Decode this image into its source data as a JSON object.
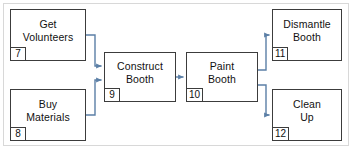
{
  "diagram": {
    "type": "precedence-network-diagram",
    "connector_color": "#5b7fa6",
    "box_border_color": "#3c3c3c",
    "frame_color": "#d8d8d8",
    "background": "#ffffff",
    "nodes": [
      {
        "id": "get-volunteers",
        "label": "Get\nVolunteers",
        "number": "7",
        "x": 10,
        "y": 9,
        "w": 76,
        "h": 52
      },
      {
        "id": "buy-materials",
        "label": "Buy\nMaterials",
        "number": "8",
        "x": 10,
        "y": 89,
        "w": 76,
        "h": 52
      },
      {
        "id": "construct-booth",
        "label": "Construct\nBooth",
        "number": "9",
        "x": 104,
        "y": 52,
        "w": 72,
        "h": 50
      },
      {
        "id": "paint-booth",
        "label": "Paint\nBooth",
        "number": "10",
        "x": 186,
        "y": 52,
        "w": 72,
        "h": 50
      },
      {
        "id": "dismantle-booth",
        "label": "Dismantle\nBooth",
        "number": "11",
        "x": 272,
        "y": 9,
        "w": 70,
        "h": 52
      },
      {
        "id": "clean-up",
        "label": "Clean\nUp",
        "number": "12",
        "x": 272,
        "y": 89,
        "w": 70,
        "h": 52
      }
    ],
    "edges": [
      {
        "id": "edge-get-volunteers-to-construct-booth",
        "from": "get-volunteers",
        "to": "construct-booth"
      },
      {
        "id": "edge-buy-materials-to-construct-booth",
        "from": "buy-materials",
        "to": "construct-booth"
      },
      {
        "id": "edge-construct-booth-to-paint-booth",
        "from": "construct-booth",
        "to": "paint-booth"
      },
      {
        "id": "edge-paint-booth-to-dismantle-booth",
        "from": "paint-booth",
        "to": "dismantle-booth"
      },
      {
        "id": "edge-paint-booth-to-clean-up",
        "from": "paint-booth",
        "to": "clean-up"
      }
    ]
  }
}
